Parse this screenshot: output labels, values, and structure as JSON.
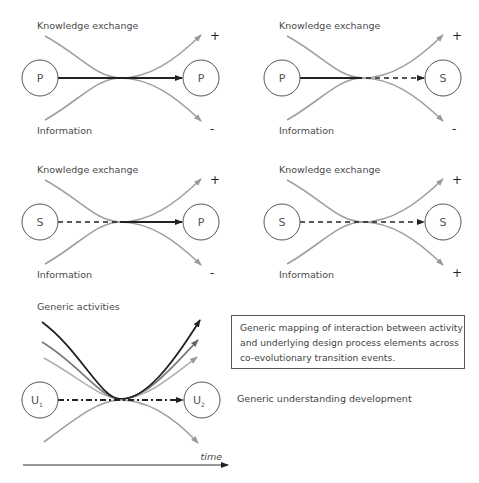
{
  "panels": [
    {
      "top_label": "Knowledge exchange",
      "bottom_label": "Information",
      "left_node": "P",
      "right_node": "P",
      "top_sign": "+",
      "bottom_sign": "-",
      "arrow": "solid"
    },
    {
      "top_label": "Knowledge exchange",
      "bottom_label": "Information",
      "left_node": "P",
      "right_node": "S",
      "top_sign": "+",
      "bottom_sign": "-",
      "arrow": "solid-then-dashed"
    },
    {
      "top_label": "Knowledge exchange",
      "bottom_label": "Information",
      "left_node": "S",
      "right_node": "P",
      "top_sign": "+",
      "bottom_sign": "-",
      "arrow": "dashed-then-solid"
    },
    {
      "top_label": "Knowledge exchange",
      "bottom_label": "Information",
      "left_node": "S",
      "right_node": "S",
      "top_sign": "+",
      "bottom_sign": "+",
      "arrow": "dashed"
    }
  ],
  "generic": {
    "top_label": "Generic activities",
    "left_node": "U",
    "left_sub": "1",
    "right_node": "U",
    "right_sub": "2",
    "arrow": "dash-dot",
    "understanding_label": "Generic understanding development",
    "time_label": "time"
  },
  "caption_box": {
    "line1": "Generic mapping of interaction between activity",
    "line2": "and underlying  design process elements across",
    "line3": "co-evolutionary transition events."
  },
  "colors": {
    "curve": "#a0a0a0",
    "dark": "#222222",
    "circle": "#555555"
  }
}
